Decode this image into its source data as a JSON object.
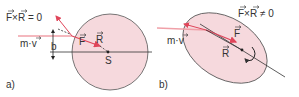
{
  "panel_a": {
    "label": "a)",
    "formula": "F×R = 0",
    "momentum_label": "m·v",
    "distance_label": "b",
    "force_label": "F",
    "radius_label": "R",
    "center_label": "S"
  },
  "panel_b": {
    "label": "b)",
    "formula": "F×R ≠ 0",
    "momentum_label": "m·v",
    "force_label": "F",
    "radius_label": "R"
  },
  "colors": {
    "body_fill": "#f6d9dd",
    "outline": "#444444",
    "arrow_red": "#e0455a",
    "arrow_pink": "#f0a0a8",
    "text": "#333333"
  }
}
